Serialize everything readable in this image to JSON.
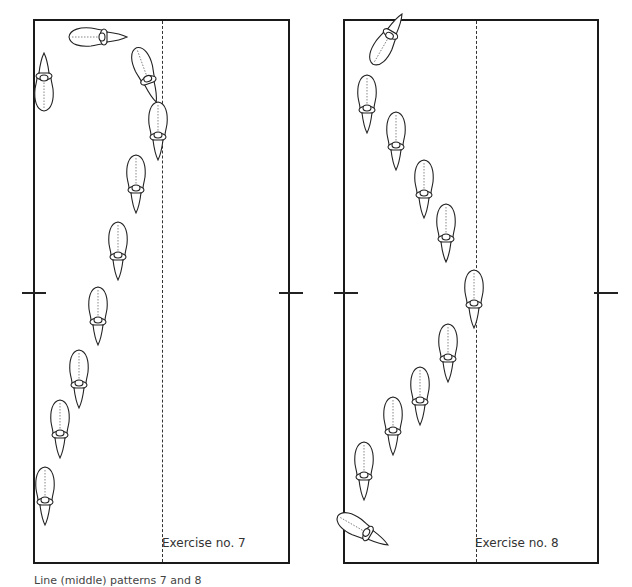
{
  "diagrams": [
    {
      "title": "Exercise no. 7",
      "horses": [
        {
          "x": 97,
          "y": 37,
          "rot": 270
        },
        {
          "x": 44,
          "y": 83,
          "rot": 180
        },
        {
          "x": 146,
          "y": 74,
          "rot": 340
        },
        {
          "x": 158,
          "y": 130,
          "rot": 0
        },
        {
          "x": 136,
          "y": 183,
          "rot": 0
        },
        {
          "x": 118,
          "y": 250,
          "rot": 0
        },
        {
          "x": 98,
          "y": 315,
          "rot": 0
        },
        {
          "x": 79,
          "y": 378,
          "rot": 0
        },
        {
          "x": 60,
          "y": 428,
          "rot": 0
        },
        {
          "x": 45,
          "y": 495,
          "rot": 0
        }
      ]
    },
    {
      "title": "Exercise no. 8",
      "horses": [
        {
          "x": 387,
          "y": 40,
          "rot": 210
        },
        {
          "x": 367,
          "y": 103,
          "rot": 0
        },
        {
          "x": 396,
          "y": 140,
          "rot": 0
        },
        {
          "x": 424,
          "y": 188,
          "rot": 0
        },
        {
          "x": 446,
          "y": 232,
          "rot": 0
        },
        {
          "x": 474,
          "y": 298,
          "rot": 0
        },
        {
          "x": 448,
          "y": 352,
          "rot": 0
        },
        {
          "x": 420,
          "y": 395,
          "rot": 0
        },
        {
          "x": 393,
          "y": 425,
          "rot": 0
        },
        {
          "x": 364,
          "y": 470,
          "rot": 0
        },
        {
          "x": 362,
          "y": 530,
          "rot": 300
        }
      ]
    }
  ],
  "caption": "Line (middle) patterns 7 and 8",
  "colors": {
    "stroke": "#1a1a1a",
    "background": "#ffffff"
  }
}
